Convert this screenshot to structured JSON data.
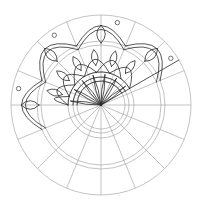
{
  "title": "Mandala line drawing (partially inked)",
  "colors": {
    "background": "#ffffff",
    "guide_lines": "#9a9a9a",
    "ink_lines": "#2a2a2a"
  },
  "geometry": {
    "center": [
      101,
      105
    ],
    "ring_radii": [
      24,
      28,
      33,
      60,
      64,
      90
    ],
    "spokes": 16,
    "inked_sector_degrees": [
      150,
      360
    ]
  }
}
